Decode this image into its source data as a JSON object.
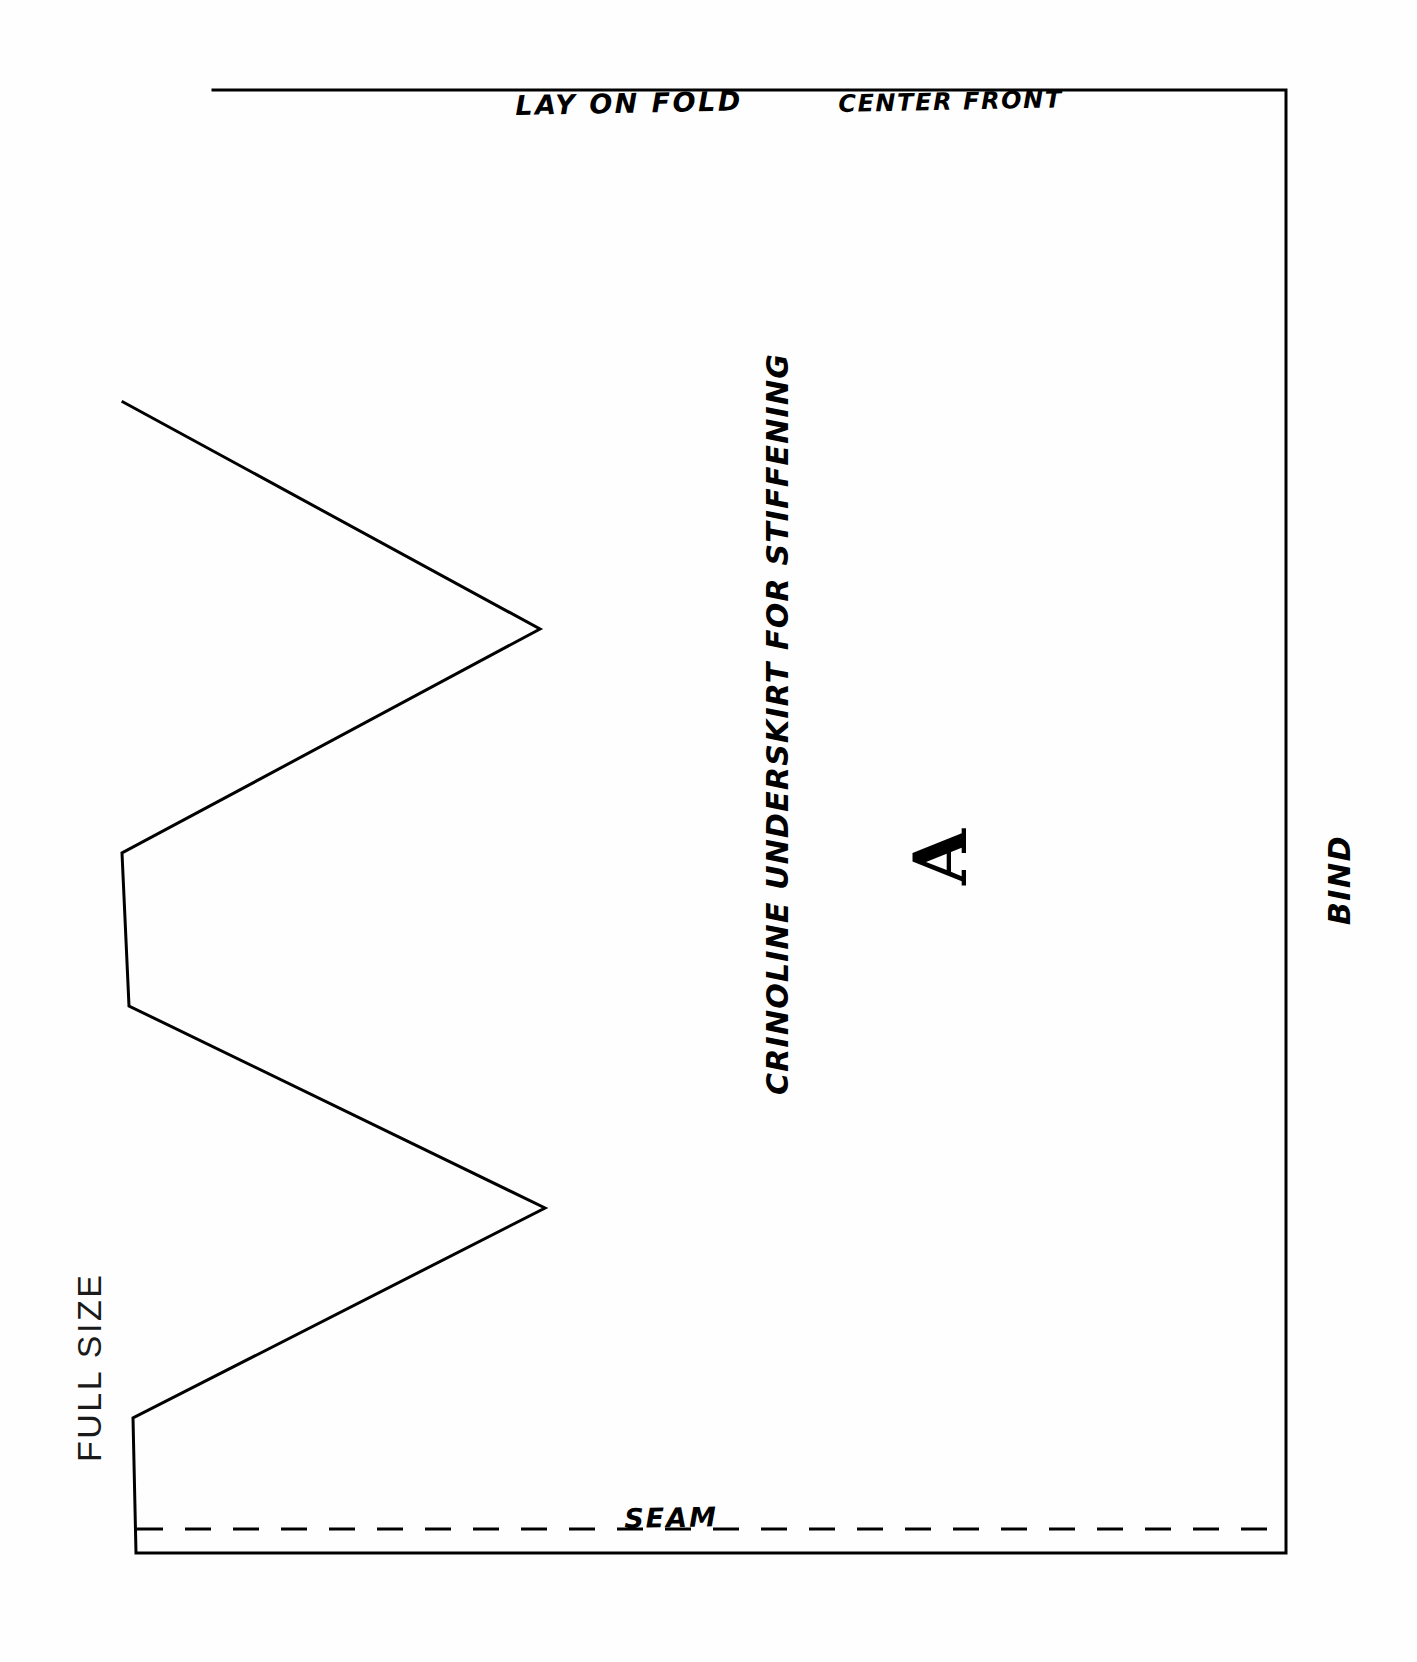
{
  "document": {
    "kind": "sewing-pattern-sheet",
    "title": "Crinoline Underskirt Pattern Piece A",
    "paper_color": "#fefefe",
    "ink_color": "#000000"
  },
  "labels": {
    "lay_on_fold": "LAY ON FOLD",
    "center_front": "CENTER FRONT",
    "crinoline": "CRINOLINE UNDERSKIRT FOR STIFFENING",
    "piece_letter": "A",
    "bind": "BIND",
    "seam": "SEAM",
    "full_size": "FULL SIZE"
  },
  "chart_data": {
    "type": "line",
    "xlabel": "",
    "ylabel": "",
    "xlim": [
      0,
      1417
    ],
    "ylim": [
      0,
      1662
    ],
    "grid": false,
    "legend": "none",
    "annotations": [
      {
        "text": "LAY ON FOLD",
        "x": 515,
        "y": 92,
        "rotation": -1.2,
        "style": "hand-lettered"
      },
      {
        "text": "CENTER FRONT",
        "x": 838,
        "y": 92,
        "rotation": -1.2,
        "style": "hand-lettered"
      },
      {
        "text": "CRINOLINE UNDERSKIRT FOR STIFFENING",
        "x": 763,
        "y": 1095,
        "rotation": -90,
        "style": "hand-lettered"
      },
      {
        "text": "A",
        "x": 905,
        "y": 885,
        "rotation": -90,
        "style": "serif-bold"
      },
      {
        "text": "BIND",
        "x": 1325,
        "y": 925,
        "rotation": -90,
        "style": "hand-lettered"
      },
      {
        "text": "SEAM",
        "x": 624,
        "y": 1505,
        "rotation": -1,
        "style": "hand-lettered"
      },
      {
        "text": "FULL SIZE",
        "x": 72,
        "y": 1462,
        "rotation": -90,
        "style": "sans-plain"
      }
    ],
    "series": [
      {
        "name": "pattern-outline",
        "kind": "closed-polyline",
        "stroke": "#000000",
        "stroke_width": 3,
        "fill": "none",
        "points": [
          [
            213,
            90
          ],
          [
            1286,
            90
          ],
          [
            1286,
            1553
          ],
          [
            136,
            1553
          ],
          [
            133,
            1418
          ],
          [
            545,
            1208
          ],
          [
            129,
            1006
          ],
          [
            122,
            853
          ],
          [
            540,
            629
          ],
          [
            123,
            402
          ]
        ]
      },
      {
        "name": "seam-dashed-line",
        "kind": "dashed-line",
        "stroke": "#000000",
        "stroke_width": 3,
        "dash": "26 22",
        "points": [
          [
            137,
            1529
          ],
          [
            1284,
            1529
          ]
        ]
      }
    ],
    "notes": [
      "Zigzag scalloped edge on the left side with 3 outward points and 2 inward valleys.",
      "Right edge is the binding edge; top edge is the fold / center front.",
      "Bottom edge carries a dashed seam allowance line."
    ]
  }
}
